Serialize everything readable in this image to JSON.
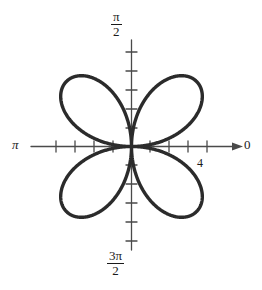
{
  "figure": {
    "kind": "polar-rose-plot",
    "background_color": "#ffffff",
    "curve_color": "#2b2b2b",
    "axis_color": "#4a4a4a",
    "label_color": "#1a1a1a"
  },
  "labels": {
    "angle_top_numerator": "π",
    "angle_top_denominator": "2",
    "angle_bottom_numerator": "3π",
    "angle_bottom_denominator": "2",
    "angle_left": "π",
    "angle_right": "0",
    "radial_tick": "4"
  },
  "chart_data": {
    "type": "line",
    "subtype": "polar-rose",
    "title": "",
    "equation": "r = 4 sin(2θ)",
    "petal_count": 4,
    "max_radius": 4,
    "xlabel": "",
    "ylabel": "",
    "grid": false,
    "legend": null,
    "polar_axis_labels": {
      "0": "0",
      "90": "π/2",
      "180": "π",
      "270": "3π/2"
    },
    "radial_ticks": [
      1,
      2,
      3,
      4
    ],
    "radial_tick_labeled": 4,
    "axis_arrow_direction": "right",
    "petal_axis_angles_deg": [
      45,
      135,
      225,
      315
    ],
    "theta_deg": [
      0,
      5,
      10,
      15,
      20,
      25,
      30,
      35,
      40,
      45,
      50,
      55,
      60,
      65,
      70,
      75,
      80,
      85,
      90,
      95,
      100,
      105,
      110,
      115,
      120,
      125,
      130,
      135,
      140,
      145,
      150,
      155,
      160,
      165,
      170,
      175,
      180,
      185,
      190,
      195,
      200,
      205,
      210,
      215,
      220,
      225,
      230,
      235,
      240,
      245,
      250,
      255,
      260,
      265,
      270,
      275,
      280,
      285,
      290,
      295,
      300,
      305,
      310,
      315,
      320,
      325,
      330,
      335,
      340,
      345,
      350,
      355,
      360
    ],
    "r_values": [
      0.0,
      0.69,
      1.37,
      2.0,
      2.57,
      3.06,
      3.46,
      3.76,
      3.94,
      4.0,
      3.94,
      3.76,
      3.46,
      3.06,
      2.57,
      2.0,
      1.37,
      0.69,
      0.0,
      -0.69,
      -1.37,
      -2.0,
      -2.57,
      -3.06,
      -3.46,
      -3.76,
      -3.94,
      -4.0,
      -3.94,
      -3.76,
      -3.46,
      -3.06,
      -2.57,
      -2.0,
      -1.37,
      -0.69,
      0.0,
      0.69,
      1.37,
      2.0,
      2.57,
      3.06,
      3.46,
      3.76,
      3.94,
      4.0,
      3.94,
      3.76,
      3.46,
      3.06,
      2.57,
      2.0,
      1.37,
      0.69,
      0.0,
      -0.69,
      -1.37,
      -2.0,
      -2.57,
      -3.06,
      -3.46,
      -3.76,
      -3.94,
      -4.0,
      -3.94,
      -3.76,
      -3.46,
      -3.06,
      -2.57,
      -2.0,
      -1.37,
      -0.69,
      0.0
    ],
    "petal_tips": [
      {
        "angle_deg": 45,
        "r": 4
      },
      {
        "angle_deg": 135,
        "r": 4
      },
      {
        "angle_deg": 225,
        "r": 4
      },
      {
        "angle_deg": 315,
        "r": 4
      }
    ]
  }
}
